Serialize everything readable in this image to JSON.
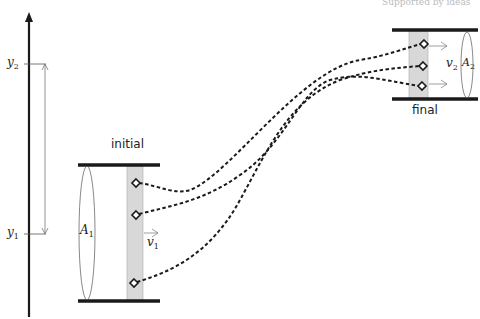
{
  "diagram": {
    "type": "fluid-flow-pipe-diagram",
    "header_faint_text": "Supported by ideas",
    "axis": {
      "label_y1": "y",
      "label_y1_sub": "1",
      "label_y2": "y",
      "label_y2_sub": "2"
    },
    "initial": {
      "label": "initial",
      "area_label": "A",
      "area_sub": "1",
      "velocity_label": "v",
      "velocity_sub": "1"
    },
    "final": {
      "label": "final",
      "area_label": "A",
      "area_sub": "2",
      "velocity_label": "v",
      "velocity_sub": "2"
    },
    "streamlines": 3,
    "colors": {
      "line": "#1a1a1a",
      "strip_fill": "#d8d8d8",
      "thin": "#666666"
    }
  }
}
